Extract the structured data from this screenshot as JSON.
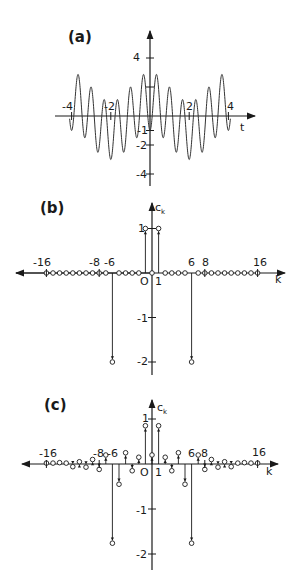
{
  "chart_data": [
    {
      "type": "line",
      "panel_label": "(a)",
      "xlabel": "t",
      "ylabel": "",
      "xlim": [
        -4.2,
        4.2
      ],
      "ylim": [
        -4.8,
        4.8
      ],
      "x_ticks": [
        -4,
        -2,
        2,
        4
      ],
      "y_ticks": [
        4,
        -1,
        -2,
        -4
      ],
      "function": "cos(pi*t/2) - 2*cos(3*pi*t)",
      "t_range": [
        -4.1,
        4.1
      ],
      "grid": false
    },
    {
      "type": "stem",
      "panel_label": "(b)",
      "xlabel": "k",
      "ylabel": "c_k",
      "xlim": [
        -19,
        20
      ],
      "ylim": [
        -2.3,
        1.6
      ],
      "x_tick_labels": [
        -16,
        -8,
        -6,
        0,
        1,
        6,
        8,
        16
      ],
      "y_ticks": [
        1,
        -1,
        -2
      ],
      "k": [
        -16,
        -15,
        -14,
        -13,
        -12,
        -11,
        -10,
        -9,
        -8,
        -7,
        -6,
        -5,
        -4,
        -3,
        -2,
        -1,
        0,
        1,
        2,
        3,
        4,
        5,
        6,
        7,
        8,
        9,
        10,
        11,
        12,
        13,
        14,
        15,
        16
      ],
      "values": [
        0,
        0,
        0,
        0,
        0,
        0,
        0,
        0,
        0,
        0,
        -2,
        0,
        0,
        0,
        0,
        1,
        0,
        1,
        0,
        0,
        0,
        0,
        -2,
        0,
        0,
        0,
        0,
        0,
        0,
        0,
        0,
        0,
        0
      ]
    },
    {
      "type": "stem",
      "panel_label": "(c)",
      "xlabel": "k",
      "ylabel": "c_k",
      "xlim": [
        -19,
        20
      ],
      "ylim": [
        -2.3,
        1.5
      ],
      "x_tick_labels": [
        -16,
        -8,
        -6,
        0,
        1,
        6,
        8,
        16
      ],
      "y_ticks": [
        1,
        -1,
        -2
      ],
      "k": [
        -16,
        -15,
        -14,
        -13,
        -12,
        -11,
        -10,
        -9,
        -8,
        -7,
        -6,
        -5,
        -4,
        -3,
        -2,
        -1,
        0,
        1,
        2,
        3,
        4,
        5,
        6,
        7,
        8,
        9,
        10,
        11,
        12,
        13,
        14,
        15,
        16
      ],
      "values": [
        0.02,
        0.02,
        0.03,
        0.02,
        -0.06,
        0.05,
        -0.07,
        0.1,
        -0.12,
        0.2,
        -1.76,
        -0.45,
        0.25,
        -0.15,
        0.15,
        0.85,
        0.2,
        0.85,
        0.15,
        -0.15,
        0.25,
        -0.45,
        -1.76,
        0.2,
        -0.12,
        0.1,
        -0.07,
        0.05,
        -0.06,
        0.02,
        0.03,
        0.02,
        0.02
      ]
    }
  ],
  "panels": {
    "a": {
      "label": "(a)",
      "xlabel": "t",
      "xticks": [
        "-4",
        "-2",
        "2",
        "4"
      ],
      "yticks": [
        "4",
        "-1",
        "-2",
        "-4"
      ]
    },
    "b": {
      "label": "(b)",
      "xlabel": "k",
      "ylabel": "c",
      "ylabel_sub": "k",
      "xticks": [
        "-16",
        "-8",
        "-6",
        "O",
        "1",
        "6",
        "8",
        "16"
      ],
      "yticks": [
        "1",
        "-1",
        "-2"
      ]
    },
    "c": {
      "label": "(c)",
      "xlabel": "k",
      "ylabel": "c",
      "ylabel_sub": "k",
      "xticks": [
        "-16",
        "-8",
        "-6",
        "O",
        "1",
        "6",
        "8",
        "16"
      ],
      "yticks": [
        "1",
        "-1",
        "-2"
      ]
    }
  },
  "colors": {
    "ink": "#1a1a1a",
    "background": "#ffffff"
  }
}
